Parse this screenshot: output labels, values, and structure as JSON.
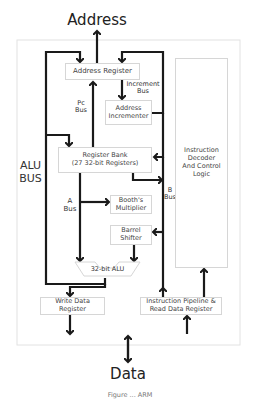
{
  "diagram": {
    "top_label": "Address",
    "bottom_label": "Data",
    "caption": "Figure ... ARM",
    "side_label": "ALU\nBUS",
    "blocks": {
      "address_register": "Address Register",
      "address_incrementer": "Address\nIncrementer",
      "register_bank": "Register Bank\n(27 32-bit Registers)",
      "booths_multiplier": "Booth's\nMultiplier",
      "barrel_shifter": "Barrel\nShifter",
      "alu": "32-bit ALU",
      "write_data_register": "Write Data\nRegister",
      "instruction_pipeline": "Instruction Pipeline &\nRead Data Register",
      "instruction_decoder": "Instruction\nDecoder\nAnd Control\nLogic"
    },
    "bus_labels": {
      "increment_bus": "Increment\nBus",
      "pc_bus": "Pc\nBus",
      "a_bus": "A\nBus",
      "b_bus": "B\nBus"
    },
    "colors": {
      "line": "#1a1a1a",
      "box_border": "#d6d6d6",
      "frame_border": "#e2e2e2"
    }
  }
}
